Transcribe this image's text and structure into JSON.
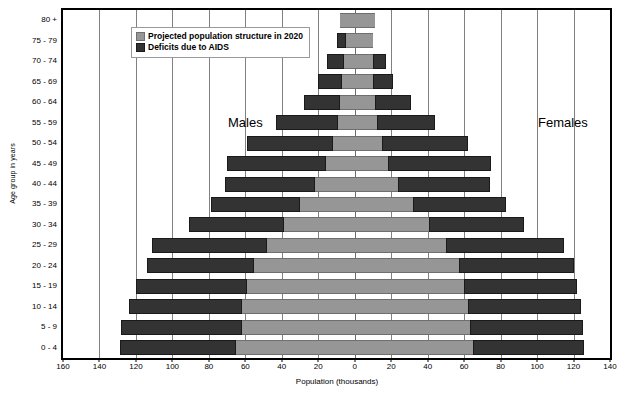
{
  "chart_data": {
    "type": "bar",
    "subtype": "population-pyramid",
    "title": "",
    "xlabel": "Population (thousands)",
    "ylabel": "Age group in years",
    "xlim": [
      -160,
      140
    ],
    "xticks": [
      -160,
      -140,
      -120,
      -100,
      -80,
      -60,
      -40,
      -20,
      0,
      20,
      40,
      60,
      80,
      100,
      120,
      140
    ],
    "xtick_labels": [
      "160",
      "140",
      "120",
      "100",
      "80",
      "60",
      "40",
      "20",
      "0",
      "20",
      "40",
      "60",
      "80",
      "100",
      "120",
      "140"
    ],
    "grid": true,
    "legend_position": "top-left",
    "side_labels": {
      "left": "Males",
      "right": "Females"
    },
    "colors": {
      "projected": "#969696",
      "deficits": "#333333",
      "grid": "#808080",
      "frame": "#000000"
    },
    "categories": [
      "0 - 4",
      "5 - 9",
      "10 - 14",
      "15 - 19",
      "20 - 24",
      "25 - 29",
      "30 - 34",
      "35 - 39",
      "40 - 44",
      "45 - 49",
      "50 - 54",
      "55 - 59",
      "60 - 64",
      "65 - 69",
      "70 - 74",
      "75 - 79",
      "80 +"
    ],
    "series": [
      {
        "name": "Projected population structure in 2020",
        "side": "male",
        "values": [
          65,
          62,
          62,
          59,
          55,
          48,
          39,
          30,
          22,
          16,
          12,
          9,
          8,
          7,
          6,
          5,
          8
        ]
      },
      {
        "name": "Deficits due to AIDS",
        "side": "male",
        "values": [
          64,
          66,
          62,
          61,
          59,
          63,
          52,
          49,
          49,
          54,
          47,
          34,
          20,
          13,
          9,
          5,
          0
        ]
      },
      {
        "name": "Projected population structure in 2020",
        "side": "female",
        "values": [
          65,
          63,
          62,
          60,
          57,
          50,
          41,
          32,
          24,
          18,
          15,
          12,
          11,
          10,
          10,
          10,
          11
        ]
      },
      {
        "name": "Deficits due to AIDS",
        "side": "female",
        "values": [
          61,
          62,
          62,
          62,
          63,
          65,
          52,
          51,
          50,
          57,
          47,
          32,
          20,
          11,
          7,
          0,
          0
        ]
      }
    ],
    "rows": [
      {
        "age": "0 - 4",
        "male_projected": 65,
        "male_deficit": 64,
        "female_projected": 65,
        "female_deficit": 61
      },
      {
        "age": "5 - 9",
        "male_projected": 62,
        "male_deficit": 66,
        "female_projected": 63,
        "female_deficit": 62
      },
      {
        "age": "10 - 14",
        "male_projected": 62,
        "male_deficit": 62,
        "female_projected": 62,
        "female_deficit": 62
      },
      {
        "age": "15 - 19",
        "male_projected": 59,
        "male_deficit": 61,
        "female_projected": 60,
        "female_deficit": 62
      },
      {
        "age": "20 - 24",
        "male_projected": 55,
        "male_deficit": 59,
        "female_projected": 57,
        "female_deficit": 63
      },
      {
        "age": "25 - 29",
        "male_projected": 48,
        "male_deficit": 63,
        "female_projected": 50,
        "female_deficit": 65
      },
      {
        "age": "30 - 34",
        "male_projected": 39,
        "male_deficit": 52,
        "female_projected": 41,
        "female_deficit": 52
      },
      {
        "age": "35 - 39",
        "male_projected": 30,
        "male_deficit": 49,
        "female_projected": 32,
        "female_deficit": 51
      },
      {
        "age": "40 - 44",
        "male_projected": 22,
        "male_deficit": 49,
        "female_projected": 24,
        "female_deficit": 50
      },
      {
        "age": "45 - 49",
        "male_projected": 16,
        "male_deficit": 54,
        "female_projected": 18,
        "female_deficit": 57
      },
      {
        "age": "50 - 54",
        "male_projected": 12,
        "male_deficit": 47,
        "female_projected": 15,
        "female_deficit": 47
      },
      {
        "age": "55 - 59",
        "male_projected": 9,
        "male_deficit": 34,
        "female_projected": 12,
        "female_deficit": 32
      },
      {
        "age": "60 - 64",
        "male_projected": 8,
        "male_deficit": 20,
        "female_projected": 11,
        "female_deficit": 20
      },
      {
        "age": "65 - 69",
        "male_projected": 7,
        "male_deficit": 13,
        "female_projected": 10,
        "female_deficit": 11
      },
      {
        "age": "70 - 74",
        "male_projected": 6,
        "male_deficit": 9,
        "female_projected": 10,
        "female_deficit": 7
      },
      {
        "age": "75 - 79",
        "male_projected": 5,
        "male_deficit": 5,
        "female_projected": 10,
        "female_deficit": 0
      },
      {
        "age": "80 +",
        "male_projected": 8,
        "male_deficit": 0,
        "female_projected": 11,
        "female_deficit": 0
      }
    ]
  },
  "legend": {
    "items": [
      {
        "label": "Projected population structure in 2020",
        "swatch": "projected"
      },
      {
        "label": "Deficits due to AIDS",
        "swatch": "deficits"
      }
    ]
  }
}
